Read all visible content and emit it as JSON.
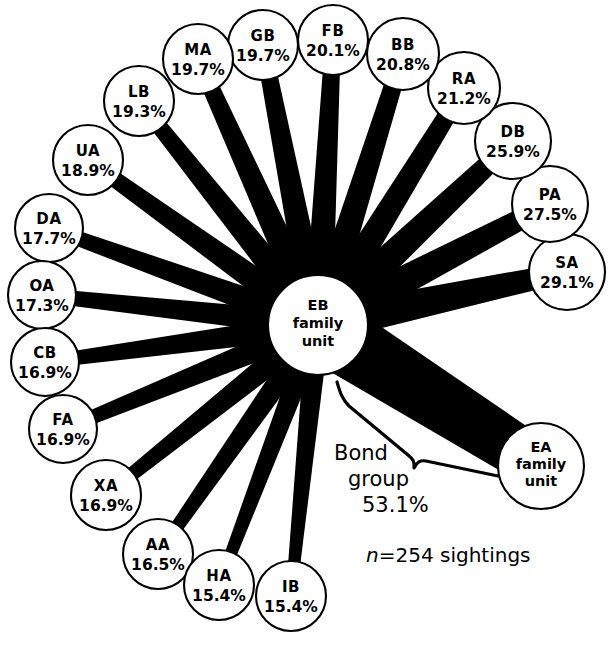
{
  "figure": {
    "type": "radial-association-sociogram",
    "hub": {
      "id": "EB",
      "line1": "EB",
      "line2": "family",
      "line3": "unit",
      "cx": 318,
      "cy": 325,
      "r": 50
    },
    "footnote": {
      "italic": "n",
      "rest": "=254 sightings",
      "full": "n=254 sightings",
      "x": 366,
      "y": 562
    },
    "annotation": {
      "line1": "Bond",
      "line2": "group",
      "line3": "53.1%",
      "x": 334,
      "y1": 460,
      "y2": 486,
      "y3": 512
    },
    "colors": {
      "ink": "#000000",
      "paper": "#ffffff"
    }
  },
  "chart_data": {
    "type": "radial-network",
    "title": "",
    "center_label": "EB family unit",
    "units": "percent of sightings associated",
    "total_sightings": 254,
    "bond_group_label": "Bond group",
    "bond_group_value": 53.1,
    "nodes": [
      {
        "id": "SA",
        "label": "SA",
        "value": 29.1,
        "value_text": "29.1%",
        "cx": 567,
        "cy": 272,
        "r": 38,
        "spoke_w_out": 22,
        "spoke_w_in": 34,
        "two_line": true
      },
      {
        "id": "PA",
        "label": "PA",
        "value": 27.5,
        "value_text": "27.5%",
        "cx": 550,
        "cy": 204,
        "r": 38,
        "spoke_w_out": 21,
        "spoke_w_in": 32,
        "two_line": true
      },
      {
        "id": "DB",
        "label": "DB",
        "value": 25.9,
        "value_text": "25.9%",
        "cx": 513,
        "cy": 141,
        "r": 38,
        "spoke_w_out": 20,
        "spoke_w_in": 31,
        "two_line": true
      },
      {
        "id": "RA",
        "label": "RA",
        "value": 21.2,
        "value_text": "21.2%",
        "cx": 464,
        "cy": 88,
        "r": 36,
        "spoke_w_out": 18,
        "spoke_w_in": 28,
        "two_line": true
      },
      {
        "id": "BB",
        "label": "BB",
        "value": 20.8,
        "value_text": "20.8%",
        "cx": 403,
        "cy": 54,
        "r": 36,
        "spoke_w_out": 18,
        "spoke_w_in": 28,
        "two_line": true
      },
      {
        "id": "FB",
        "label": "FB",
        "value": 20.1,
        "value_text": "20.1%",
        "cx": 333,
        "cy": 40,
        "r": 35,
        "spoke_w_out": 17,
        "spoke_w_in": 27,
        "two_line": true
      },
      {
        "id": "GB",
        "label": "GB",
        "value": 19.7,
        "value_text": "19.7%",
        "cx": 263,
        "cy": 45,
        "r": 35,
        "spoke_w_out": 17,
        "spoke_w_in": 27,
        "two_line": true
      },
      {
        "id": "MA",
        "label": "MA",
        "value": 19.7,
        "value_text": "19.7%",
        "cx": 198,
        "cy": 59,
        "r": 35,
        "spoke_w_out": 17,
        "spoke_w_in": 27,
        "two_line": true
      },
      {
        "id": "LB",
        "label": "LB",
        "value": 19.3,
        "value_text": "19.3%",
        "cx": 139,
        "cy": 101,
        "r": 35,
        "spoke_w_out": 16,
        "spoke_w_in": 26,
        "two_line": true
      },
      {
        "id": "UA",
        "label": "UA",
        "value": 18.9,
        "value_text": "18.9%",
        "cx": 88,
        "cy": 160,
        "r": 35,
        "spoke_w_out": 16,
        "spoke_w_in": 26,
        "two_line": true
      },
      {
        "id": "DA",
        "label": "DA",
        "value": 17.7,
        "value_text": "17.7%",
        "cx": 49,
        "cy": 228,
        "r": 34,
        "spoke_w_out": 15,
        "spoke_w_in": 25,
        "two_line": true
      },
      {
        "id": "OA",
        "label": "OA",
        "value": 17.3,
        "value_text": "17.3%",
        "cx": 42,
        "cy": 295,
        "r": 34,
        "spoke_w_out": 15,
        "spoke_w_in": 24,
        "two_line": true
      },
      {
        "id": "CB",
        "label": "CB",
        "value": 16.9,
        "value_text": "16.9%",
        "cx": 45,
        "cy": 362,
        "r": 34,
        "spoke_w_out": 14,
        "spoke_w_in": 24,
        "two_line": true
      },
      {
        "id": "FA",
        "label": "FA",
        "value": 16.9,
        "value_text": "16.9%",
        "cx": 63,
        "cy": 429,
        "r": 34,
        "spoke_w_out": 14,
        "spoke_w_in": 24,
        "two_line": true
      },
      {
        "id": "XA",
        "label": "XA",
        "value": 16.9,
        "value_text": "16.9%",
        "cx": 106,
        "cy": 495,
        "r": 35,
        "spoke_w_out": 14,
        "spoke_w_in": 24,
        "two_line": true
      },
      {
        "id": "AA",
        "label": "AA",
        "value": 16.5,
        "value_text": "16.5%",
        "cx": 158,
        "cy": 554,
        "r": 35,
        "spoke_w_out": 13,
        "spoke_w_in": 23,
        "two_line": true
      },
      {
        "id": "HA",
        "label": "HA",
        "value": 15.4,
        "value_text": "15.4%",
        "cx": 219,
        "cy": 585,
        "r": 35,
        "spoke_w_out": 12,
        "spoke_w_in": 22,
        "two_line": true
      },
      {
        "id": "IB",
        "label": "IB",
        "value": 15.4,
        "value_text": "15.4%",
        "cx": 291,
        "cy": 596,
        "r": 35,
        "spoke_w_out": 12,
        "spoke_w_in": 22,
        "two_line": true
      }
    ],
    "bond_node": {
      "id": "EA",
      "line1": "EA",
      "line2": "family",
      "line3": "unit",
      "value": 53.1,
      "value_text": "53.1%",
      "cx": 541,
      "cy": 466,
      "r": 43,
      "spoke_w_out": 52,
      "spoke_w_in": 66
    }
  }
}
